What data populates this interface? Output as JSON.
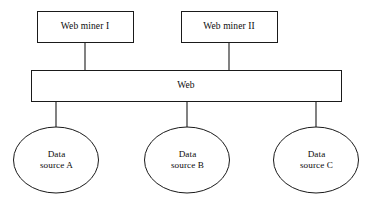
{
  "diagram": {
    "background_color": "#ffffff",
    "stroke_color": "#1a1a1a",
    "text_color": "#0d0d0d",
    "miners": [
      {
        "id": "web-miner-1",
        "label": "Web miner I"
      },
      {
        "id": "web-miner-2",
        "label": "Web miner II"
      }
    ],
    "hub": {
      "id": "web-bar",
      "label": "Web"
    },
    "sources": [
      {
        "id": "data-source-a",
        "line1": "Data",
        "line2": "source A"
      },
      {
        "id": "data-source-b",
        "line1": "Data",
        "line2": "source B"
      },
      {
        "id": "data-source-c",
        "line1": "Data",
        "line2": "source C"
      }
    ]
  }
}
